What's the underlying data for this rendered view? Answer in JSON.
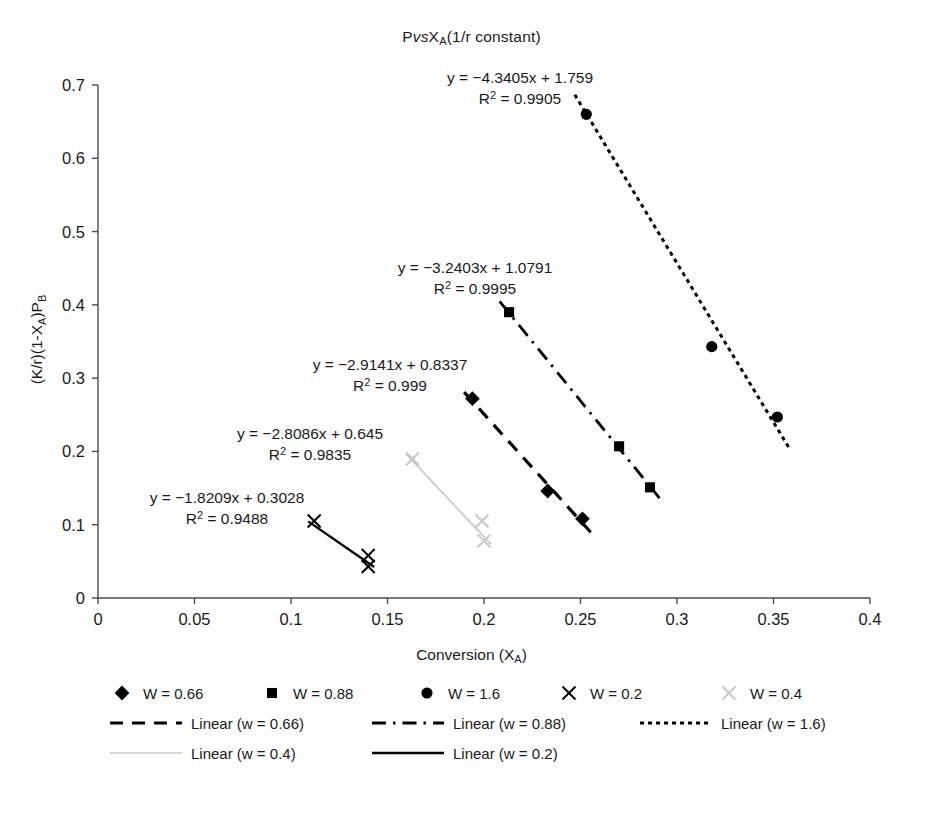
{
  "chart_data": {
    "type": "scatter",
    "title_parts": {
      "p": "P",
      "vs": "vs",
      "x": "X",
      "sub": "A",
      "tail": "(1/r constant)"
    },
    "xlabel": "Conversion (X_A)",
    "xlabel_parts": {
      "main": "Conversion (X",
      "sub": "A",
      "tail": ")"
    },
    "ylabel": "(K/r)(1-X_A)P_B",
    "ylabel_parts": {
      "a": "(K/r)(1-X",
      "subA": "A",
      "b": ")P",
      "subB": "B"
    },
    "xlim": [
      0,
      0.4
    ],
    "ylim": [
      0,
      0.7
    ],
    "xticks": [
      "0",
      "0.05",
      "0.1",
      "0.15",
      "0.2",
      "0.25",
      "0.3",
      "0.35",
      "0.4"
    ],
    "xtick_values": [
      0,
      0.05,
      0.1,
      0.15,
      0.2,
      0.25,
      0.3,
      0.35,
      0.4
    ],
    "yticks": [
      "0",
      "0.1",
      "0.2",
      "0.3",
      "0.4",
      "0.5",
      "0.6",
      "0.7"
    ],
    "ytick_values": [
      0,
      0.1,
      0.2,
      0.3,
      0.4,
      0.5,
      0.6,
      0.7
    ],
    "grid": false,
    "legend_position": "bottom",
    "series": [
      {
        "name": "W = 0.66",
        "marker": "diamond",
        "color": "#000000",
        "line_style": "dashed",
        "x": [
          0.194,
          0.233,
          0.251
        ],
        "y": [
          0.272,
          0.146,
          0.108
        ],
        "fit": {
          "slope": -2.9141,
          "intercept": 0.8337,
          "r2": 0.999
        },
        "fit_label_line1": "y = −2.9141x + 0.8337",
        "fit_label_line2": "R² = 0.999"
      },
      {
        "name": "W = 0.88",
        "marker": "square",
        "color": "#000000",
        "line_style": "dash-dot",
        "x": [
          0.213,
          0.27,
          0.286
        ],
        "y": [
          0.39,
          0.207,
          0.151
        ],
        "fit": {
          "slope": -3.2403,
          "intercept": 1.0791,
          "r2": 0.9995
        },
        "fit_label_line1": "y = −3.2403x + 1.0791",
        "fit_label_line2": "R² = 0.9995"
      },
      {
        "name": "W = 1.6",
        "marker": "circle",
        "color": "#000000",
        "line_style": "dotted",
        "x": [
          0.253,
          0.318,
          0.352
        ],
        "y": [
          0.66,
          0.343,
          0.247
        ],
        "fit": {
          "slope": -4.3405,
          "intercept": 1.759,
          "r2": 0.9905
        },
        "fit_label_line1": "y = −4.3405x + 1.759",
        "fit_label_line2": "R² = 0.9905"
      },
      {
        "name": "W = 0.2",
        "marker": "cross",
        "color": "#000000",
        "line_style": "solid",
        "x": [
          0.112,
          0.14,
          0.14
        ],
        "y": [
          0.105,
          0.058,
          0.043
        ],
        "fit": {
          "slope": -1.8209,
          "intercept": 0.3028,
          "r2": 0.9488
        },
        "fit_label_line1": "y = −1.8209x + 0.3028",
        "fit_label_line2": "R² = 0.9488"
      },
      {
        "name": "W = 0.4",
        "marker": "cross",
        "color": "#c8c8c8",
        "line_style": "solid-light",
        "x": [
          0.163,
          0.199,
          0.2
        ],
        "y": [
          0.19,
          0.105,
          0.078
        ],
        "fit": {
          "slope": -2.8086,
          "intercept": 0.645,
          "r2": 0.9835
        },
        "fit_label_line1": "y = −2.8086x + 0.645",
        "fit_label_line2": "R² = 0.9835"
      }
    ],
    "annotations": [
      {
        "line1": "y = −4.3405x + 1.759",
        "line2": "R² = 0.9905"
      },
      {
        "line1": "y = −3.2403x + 1.0791",
        "line2": "R² = 0.9995"
      },
      {
        "line1": "y = −2.9141x + 0.8337",
        "line2": "R² = 0.999"
      },
      {
        "line1": "y = −2.8086x + 0.645",
        "line2": "R² = 0.9835"
      },
      {
        "line1": "y = −1.8209x + 0.3028",
        "line2": "R² = 0.9488"
      }
    ]
  },
  "legend": {
    "markers": [
      {
        "label": "W = 0.66",
        "marker": "diamond",
        "color": "#000000"
      },
      {
        "label": "W = 0.88",
        "marker": "square",
        "color": "#000000"
      },
      {
        "label": "W = 1.6",
        "marker": "circle",
        "color": "#000000"
      },
      {
        "label": "W = 0.2",
        "marker": "cross",
        "color": "#000000"
      },
      {
        "label": "W = 0.4",
        "marker": "cross",
        "color": "#c8c8c8"
      }
    ],
    "lines": [
      {
        "label": "Linear (w = 0.66)",
        "style": "dashed",
        "color": "#000000"
      },
      {
        "label": "Linear (w = 0.88)",
        "style": "dash-dot",
        "color": "#000000"
      },
      {
        "label": "Linear (w = 1.6)",
        "style": "dotted",
        "color": "#000000"
      },
      {
        "label": "Linear (w = 0.4)",
        "style": "solid-light",
        "color": "#c8c8c8"
      },
      {
        "label": "Linear (w = 0.2)",
        "style": "solid",
        "color": "#000000"
      }
    ]
  },
  "colors": {
    "axis": "#4d4d4d",
    "text": "#1a1a1a",
    "series_dark": "#000000",
    "series_light": "#c8c8c8"
  }
}
